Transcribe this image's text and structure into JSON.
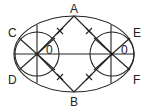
{
  "diagram": {
    "type": "geometric-construction",
    "labels": {
      "A": "A",
      "B": "B",
      "C": "C",
      "D": "D",
      "E": "E",
      "F": "F",
      "left_center": "0",
      "right_center": "0"
    },
    "colors": {
      "line": "#222222",
      "background": "#ffffff"
    }
  }
}
